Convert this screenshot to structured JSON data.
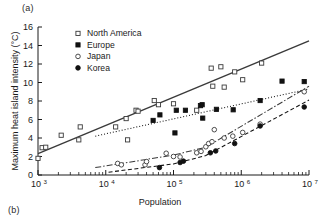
{
  "figure": {
    "panel_label_a": "(a)",
    "panel_label_b": "(b)"
  },
  "chart_data": {
    "type": "scatter",
    "title": "",
    "xlabel": "Population",
    "ylabel": "Maximum heat island intensity (°C)",
    "xscale": "log",
    "yscale": "linear",
    "xlim": [
      1000,
      10000000
    ],
    "ylim": [
      0,
      16
    ],
    "yticks": [
      0,
      2,
      4,
      6,
      8,
      10,
      12,
      14,
      16
    ],
    "ytick_labels": [
      "0",
      "2",
      "4",
      "6",
      "8",
      "10",
      "12",
      "14",
      "16"
    ],
    "xticks": [
      1000,
      10000,
      100000,
      1000000,
      10000000
    ],
    "xtick_labels": [
      "10³",
      "10⁴",
      "10⁵",
      "10⁶",
      "10⁷"
    ],
    "xtick_mantissa": [
      "10",
      "10",
      "10",
      "10",
      "10"
    ],
    "xtick_exponent": [
      "3",
      "4",
      "5",
      "6",
      "7"
    ],
    "grid": false,
    "legend_position": "upper-left-inside",
    "series": [
      {
        "name": "North America",
        "marker": "open-square",
        "line_style": "solid",
        "color": "#3a3a3a",
        "points": [
          {
            "x": 1000,
            "y": 1.8
          },
          {
            "x": 1150,
            "y": 2.95
          },
          {
            "x": 1300,
            "y": 3.0
          },
          {
            "x": 2200,
            "y": 4.3
          },
          {
            "x": 4000,
            "y": 3.8
          },
          {
            "x": 4200,
            "y": 5.2
          },
          {
            "x": 14000,
            "y": 5.2
          },
          {
            "x": 20000,
            "y": 6.1
          },
          {
            "x": 21000,
            "y": 3.8
          },
          {
            "x": 28000,
            "y": 7.0
          },
          {
            "x": 30000,
            "y": 6.9
          },
          {
            "x": 52000,
            "y": 8.05
          },
          {
            "x": 60000,
            "y": 7.6
          },
          {
            "x": 100000,
            "y": 7.7
          },
          {
            "x": 220000,
            "y": 7.0
          },
          {
            "x": 360000,
            "y": 11.55
          },
          {
            "x": 380000,
            "y": 9.6
          },
          {
            "x": 500000,
            "y": 11.7
          },
          {
            "x": 560000,
            "y": 9.5
          },
          {
            "x": 800000,
            "y": 11.15
          },
          {
            "x": 1050000,
            "y": 10.3
          },
          {
            "x": 2000000,
            "y": 12.1
          }
        ],
        "fit_line": {
          "x0": 1000,
          "y0": 2.3,
          "x1": 10000000,
          "y1": 14.5
        }
      },
      {
        "name": "Europe",
        "marker": "filled-square",
        "line_style": "dotted",
        "color": "#111111",
        "points": [
          {
            "x": 50000,
            "y": 5.9
          },
          {
            "x": 63000,
            "y": 6.5
          },
          {
            "x": 105000,
            "y": 4.55
          },
          {
            "x": 110000,
            "y": 7.0
          },
          {
            "x": 150000,
            "y": 7.0
          },
          {
            "x": 250000,
            "y": 7.5
          },
          {
            "x": 265000,
            "y": 7.6
          },
          {
            "x": 270000,
            "y": 6.15
          },
          {
            "x": 430000,
            "y": 7.1
          },
          {
            "x": 760000,
            "y": 7.05
          },
          {
            "x": 1900000,
            "y": 8.05
          },
          {
            "x": 4000000,
            "y": 10.15
          },
          {
            "x": 8500000,
            "y": 10.1
          }
        ],
        "fit_line": {
          "x0": 7000,
          "y0": 4.2,
          "x1": 10000000,
          "y1": 9.3
        }
      },
      {
        "name": "Japan",
        "marker": "open-circle",
        "line_style": "dash-dot",
        "color": "#3a3a3a",
        "points": [
          {
            "x": 15000,
            "y": 1.25
          },
          {
            "x": 17000,
            "y": 1.1
          },
          {
            "x": 38000,
            "y": 1.1
          },
          {
            "x": 40000,
            "y": 1.45
          },
          {
            "x": 78000,
            "y": 2.35
          },
          {
            "x": 100000,
            "y": 2.0
          },
          {
            "x": 125000,
            "y": 1.95
          },
          {
            "x": 220000,
            "y": 2.4
          },
          {
            "x": 255000,
            "y": 2.55
          },
          {
            "x": 300000,
            "y": 3.05
          },
          {
            "x": 330000,
            "y": 3.4
          },
          {
            "x": 370000,
            "y": 3.6
          },
          {
            "x": 400000,
            "y": 4.9
          },
          {
            "x": 560000,
            "y": 4.0
          },
          {
            "x": 750000,
            "y": 4.2
          },
          {
            "x": 1050000,
            "y": 4.6
          },
          {
            "x": 1900000,
            "y": 5.5
          },
          {
            "x": 8500000,
            "y": 9.0
          }
        ],
        "fit_line_points": [
          {
            "x": 7000,
            "y": 0.8
          },
          {
            "x": 100000,
            "y": 2.15
          },
          {
            "x": 300000,
            "y": 3.0
          },
          {
            "x": 10000000,
            "y": 9.6
          }
        ]
      },
      {
        "name": "Korea",
        "marker": "filled-circle",
        "line_style": "dashed",
        "color": "#111111",
        "points": [
          {
            "x": 62000,
            "y": 0.8
          },
          {
            "x": 125000,
            "y": 1.35
          },
          {
            "x": 140000,
            "y": 1.5
          },
          {
            "x": 350000,
            "y": 2.4
          },
          {
            "x": 420000,
            "y": 2.6
          },
          {
            "x": 800000,
            "y": 3.4
          },
          {
            "x": 1900000,
            "y": 5.3
          },
          {
            "x": 8500000,
            "y": 7.35
          }
        ],
        "fit_line_points": [
          {
            "x": 11000,
            "y": 0.3
          },
          {
            "x": 100000,
            "y": 1.2
          },
          {
            "x": 300000,
            "y": 2.1
          },
          {
            "x": 10000000,
            "y": 8.1
          }
        ]
      }
    ],
    "legend": [
      {
        "label": "North America",
        "marker": "open-square"
      },
      {
        "label": "Europe",
        "marker": "filled-square"
      },
      {
        "label": "Japan",
        "marker": "open-circle"
      },
      {
        "label": "Korea",
        "marker": "filled-circle"
      }
    ]
  }
}
